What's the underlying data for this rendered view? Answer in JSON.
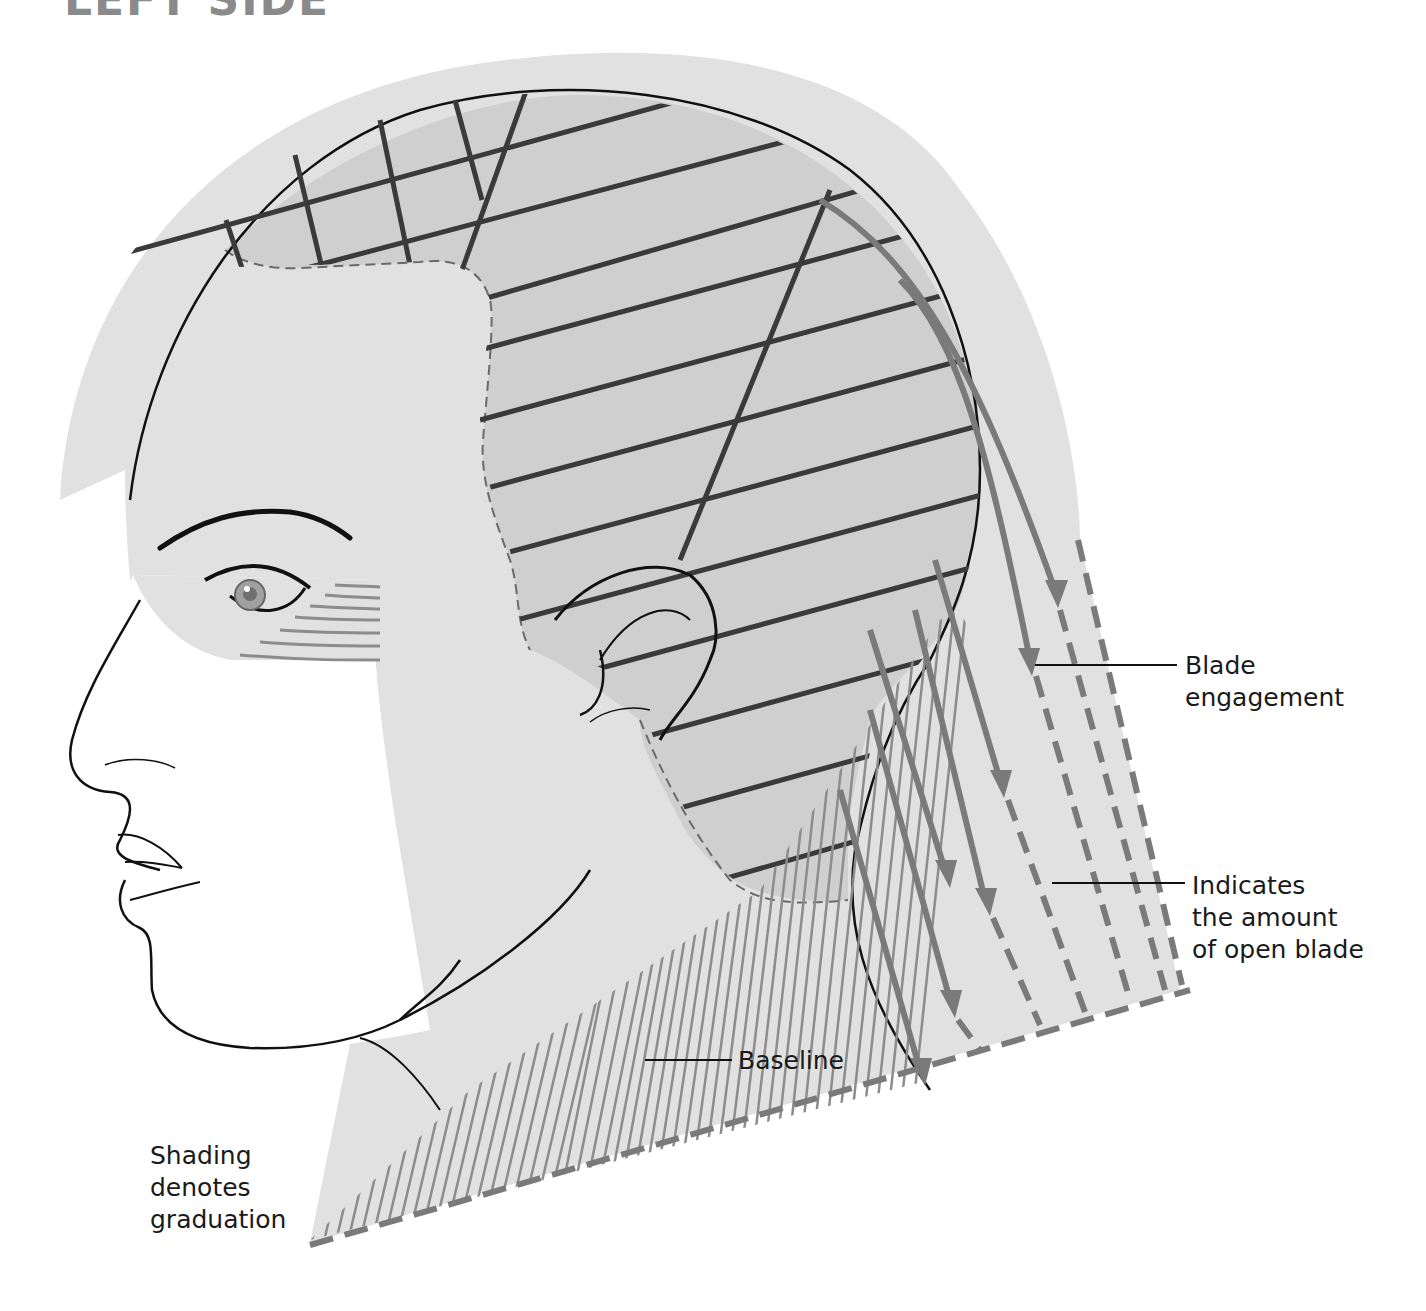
{
  "heading": "LEFT SIDE",
  "labels": {
    "blade_engagement": [
      "Blade",
      "engagement"
    ],
    "open_blade": [
      "Indicates",
      "the amount",
      "of open blade"
    ],
    "baseline": "Baseline",
    "shading": [
      "Shading",
      "denotes",
      "graduation"
    ]
  },
  "colors": {
    "background": "#ffffff",
    "skin_light": "#e1e1e1",
    "hair_shaded": "#cfcfcf",
    "grid_line": "#3a3a3a",
    "arrow": "#7a7a7a",
    "hatch": "#8c8c8c",
    "outline": "#111111"
  },
  "diagram": {
    "elements": [
      "horizontal section lines",
      "crossing vertical partings",
      "directional arrows",
      "dashed open-blade guides",
      "dashed baseline",
      "graduation hatching"
    ]
  }
}
